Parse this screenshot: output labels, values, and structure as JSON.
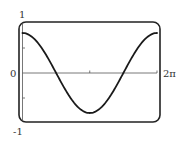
{
  "chart_data": {
    "type": "line",
    "title": "",
    "xlabel": "",
    "ylabel": "",
    "function": "y = 0.8 cos(x)",
    "xlim": [
      0,
      6.283185307
    ],
    "ylim": [
      -1,
      1
    ],
    "x_tick_labels": [
      "2π"
    ],
    "x_ticks": [
      3.141592654,
      6.283185307
    ],
    "y_tick_labels": [
      "1",
      "0",
      "-1"
    ],
    "y_ticks": [
      -0.5,
      0.5
    ],
    "grid": false,
    "legend": null,
    "series": [
      {
        "name": "curve",
        "x": [
          0,
          0.785,
          1.571,
          2.356,
          3.142,
          3.927,
          4.712,
          5.498,
          6.283
        ],
        "values": [
          0.8,
          0.57,
          0.0,
          -0.57,
          -0.8,
          -0.57,
          0.0,
          0.57,
          0.8
        ]
      }
    ]
  },
  "labels": {
    "y_top": "1",
    "y_zero": "0",
    "y_bottom": "-1",
    "x_end": "2π"
  },
  "style": {
    "curve_color": "#1a1a1a",
    "frame_color": "#222222",
    "axis_color": "#555555"
  }
}
